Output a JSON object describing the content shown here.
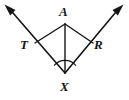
{
  "figure": {
    "type": "geometry-diagram",
    "background_color": "#ffffff",
    "stroke_color": "#151515",
    "labels": [
      {
        "id": "A",
        "text": "A",
        "x": 65,
        "y": 24
      },
      {
        "id": "T",
        "text": "T",
        "x": 35,
        "y": 43
      },
      {
        "id": "R",
        "text": "R",
        "x": 93,
        "y": 43
      },
      {
        "id": "X",
        "text": "X",
        "x": 65,
        "y": 73
      }
    ],
    "points": {
      "A": {
        "x": 65,
        "y": 24
      },
      "T": {
        "x": 35,
        "y": 43
      },
      "R": {
        "x": 93,
        "y": 43
      },
      "X": {
        "x": 65,
        "y": 73
      },
      "left_arrow_tip": {
        "x": 5,
        "y": 5
      },
      "right_arrow_tip": {
        "x": 123,
        "y": 5
      }
    },
    "segments": [
      {
        "name": "ray-X-through-T",
        "from": "X",
        "to": "left_arrow_tip",
        "arrow": true
      },
      {
        "name": "ray-X-through-R",
        "from": "X",
        "to": "right_arrow_tip",
        "arrow": true
      },
      {
        "name": "segment-A-T",
        "from": "A",
        "to": "T",
        "arrow": false
      },
      {
        "name": "segment-A-R",
        "from": "A",
        "to": "R",
        "arrow": false
      },
      {
        "name": "segment-A-X",
        "from": "A",
        "to": "X",
        "arrow": false
      }
    ],
    "angle_marks": [
      {
        "name": "angle-TXR",
        "vertex": "X",
        "radius": 13
      }
    ]
  }
}
